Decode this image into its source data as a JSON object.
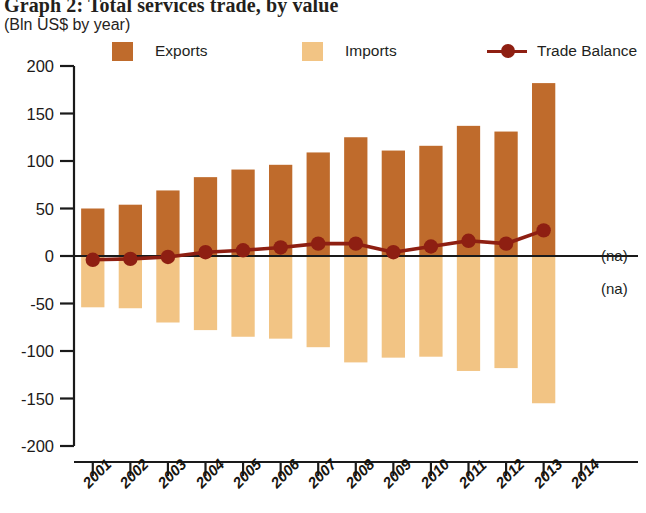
{
  "header": {
    "title": "Graph 2: Total services trade, by value",
    "subtitle": "(Bln US$ by year)"
  },
  "legend": {
    "items": [
      {
        "label": "Exports",
        "type": "swatch",
        "color": "#BF6B2C",
        "icon": "square-swatch-icon"
      },
      {
        "label": "Imports",
        "type": "swatch",
        "color": "#F2C484",
        "icon": "square-swatch-icon"
      },
      {
        "label": "Trade Balance",
        "type": "line",
        "color": "#8E1F12",
        "icon": "line-marker-icon"
      }
    ]
  },
  "annotations": {
    "na_above": "(na)",
    "na_below": "(na)"
  },
  "colors": {
    "exports": "#BF6B2C",
    "imports": "#F2C484",
    "trade_balance": "#8E1F12",
    "axis": "#1a1a1a",
    "background": "#ffffff"
  },
  "chart_data": {
    "type": "bar",
    "title": "Graph 2: Total services trade, by value",
    "subtitle": "(Bln US$ by year)",
    "xlabel": "",
    "ylabel": "Bln US$",
    "ylim": [
      -200,
      200
    ],
    "yticks": [
      200,
      150,
      100,
      50,
      0,
      -50,
      -100,
      -150,
      -200
    ],
    "ytick_labels": [
      "200",
      "150",
      "100",
      "50",
      "0",
      "-50",
      "-100",
      "-150",
      "-200"
    ],
    "grid": false,
    "legend_position": "top",
    "categories": [
      "2001",
      "2002",
      "2003",
      "2004",
      "2005",
      "2006",
      "2007",
      "2008",
      "2009",
      "2010",
      "2011",
      "2012",
      "2013",
      "2014"
    ],
    "series": [
      {
        "name": "Exports",
        "type": "bar",
        "color": "#BF6B2C",
        "values": [
          50,
          54,
          69,
          83,
          91,
          96,
          109,
          125,
          111,
          116,
          137,
          131,
          182,
          null
        ]
      },
      {
        "name": "Imports",
        "type": "bar",
        "color": "#F2C484",
        "values": [
          -54,
          -55,
          -70,
          -78,
          -85,
          -87,
          -96,
          -112,
          -107,
          -106,
          -121,
          -118,
          -155,
          null
        ]
      },
      {
        "name": "Trade Balance",
        "type": "line",
        "color": "#8E1F12",
        "values": [
          -4,
          -3,
          -1,
          4,
          6,
          9,
          13,
          13,
          4,
          10,
          16,
          13,
          27,
          null
        ]
      }
    ]
  }
}
